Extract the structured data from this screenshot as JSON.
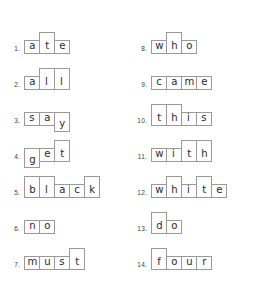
{
  "worksheet": {
    "title": "Word Shape Boxes Worksheet",
    "background_color": "#ffffff",
    "box_border_color": "#9a9a9a",
    "text_color": "#2b2b2b"
  },
  "columns": [
    {
      "name": "left-column",
      "items": [
        {
          "number": "1.",
          "word": "ate",
          "letters": [
            {
              "ch": "a",
              "shape": "short"
            },
            {
              "ch": "t",
              "shape": "tall"
            },
            {
              "ch": "e",
              "shape": "short"
            }
          ]
        },
        {
          "number": "2.",
          "word": "all",
          "letters": [
            {
              "ch": "a",
              "shape": "short"
            },
            {
              "ch": "l",
              "shape": "tall"
            },
            {
              "ch": "l",
              "shape": "tall"
            }
          ]
        },
        {
          "number": "3.",
          "word": "say",
          "letters": [
            {
              "ch": "s",
              "shape": "short"
            },
            {
              "ch": "a",
              "shape": "short"
            },
            {
              "ch": "y",
              "shape": "desc"
            }
          ]
        },
        {
          "number": "4.",
          "word": "get",
          "letters": [
            {
              "ch": "g",
              "shape": "desc"
            },
            {
              "ch": "e",
              "shape": "short"
            },
            {
              "ch": "t",
              "shape": "tall"
            }
          ]
        },
        {
          "number": "5.",
          "word": "black",
          "letters": [
            {
              "ch": "b",
              "shape": "tall"
            },
            {
              "ch": "l",
              "shape": "tall"
            },
            {
              "ch": "a",
              "shape": "short"
            },
            {
              "ch": "c",
              "shape": "short"
            },
            {
              "ch": "k",
              "shape": "tall"
            }
          ]
        },
        {
          "number": "6.",
          "word": "no",
          "letters": [
            {
              "ch": "n",
              "shape": "short"
            },
            {
              "ch": "o",
              "shape": "short"
            }
          ]
        },
        {
          "number": "7.",
          "word": "must",
          "letters": [
            {
              "ch": "m",
              "shape": "short"
            },
            {
              "ch": "u",
              "shape": "short"
            },
            {
              "ch": "s",
              "shape": "short"
            },
            {
              "ch": "t",
              "shape": "tall"
            }
          ]
        }
      ]
    },
    {
      "name": "right-column",
      "items": [
        {
          "number": "8.",
          "word": "who",
          "letters": [
            {
              "ch": "w",
              "shape": "short"
            },
            {
              "ch": "h",
              "shape": "tall"
            },
            {
              "ch": "o",
              "shape": "short"
            }
          ]
        },
        {
          "number": "9.",
          "word": "came",
          "letters": [
            {
              "ch": "c",
              "shape": "short"
            },
            {
              "ch": "a",
              "shape": "short"
            },
            {
              "ch": "m",
              "shape": "short"
            },
            {
              "ch": "e",
              "shape": "short"
            }
          ]
        },
        {
          "number": "10.",
          "word": "this",
          "letters": [
            {
              "ch": "t",
              "shape": "tall"
            },
            {
              "ch": "h",
              "shape": "tall"
            },
            {
              "ch": "i",
              "shape": "short"
            },
            {
              "ch": "s",
              "shape": "short"
            }
          ]
        },
        {
          "number": "11.",
          "word": "with",
          "letters": [
            {
              "ch": "w",
              "shape": "short"
            },
            {
              "ch": "i",
              "shape": "short"
            },
            {
              "ch": "t",
              "shape": "tall"
            },
            {
              "ch": "h",
              "shape": "tall"
            }
          ]
        },
        {
          "number": "12.",
          "word": "white",
          "letters": [
            {
              "ch": "w",
              "shape": "short"
            },
            {
              "ch": "h",
              "shape": "tall"
            },
            {
              "ch": "i",
              "shape": "short"
            },
            {
              "ch": "t",
              "shape": "tall"
            },
            {
              "ch": "e",
              "shape": "short"
            }
          ]
        },
        {
          "number": "13.",
          "word": "do",
          "letters": [
            {
              "ch": "d",
              "shape": "tall"
            },
            {
              "ch": "o",
              "shape": "short"
            }
          ]
        },
        {
          "number": "14.",
          "word": "four",
          "letters": [
            {
              "ch": "f",
              "shape": "tall"
            },
            {
              "ch": "o",
              "shape": "short"
            },
            {
              "ch": "u",
              "shape": "short"
            },
            {
              "ch": "r",
              "shape": "short"
            }
          ]
        }
      ]
    }
  ]
}
